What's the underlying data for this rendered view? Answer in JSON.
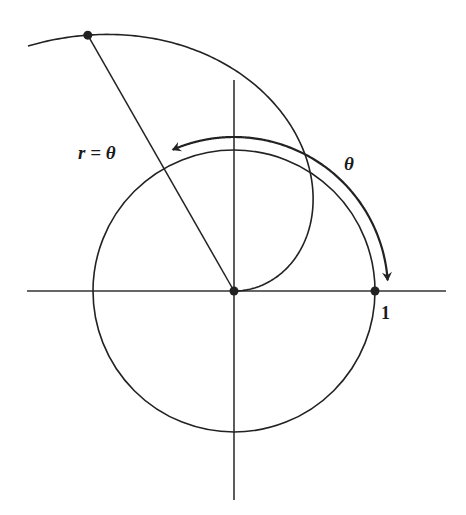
{
  "diagram": {
    "colors": {
      "ink": "#222222",
      "background": "#ffffff"
    },
    "geometry": {
      "origin_px": [
        234,
        291
      ],
      "unit_px": 141,
      "axis_x": [
        27,
        446
      ],
      "axis_y": [
        80,
        500
      ],
      "spiral_theta_end": 2.27,
      "spiral_point_theta": 2.09,
      "arrow_arc_radius_px": 154,
      "arrow_arc_theta_start": 1.98,
      "arrow_arc_theta_end": 0.07
    },
    "labels": {
      "spiral_equation": "r = θ",
      "angle": "θ",
      "unit_tick": "1"
    },
    "points": [
      {
        "name": "origin",
        "x": 0,
        "y": 0
      },
      {
        "name": "unit-point",
        "x": 1,
        "y": 0
      },
      {
        "name": "spiral-point",
        "polar_r": 2.09,
        "polar_theta": 2.09
      }
    ]
  }
}
